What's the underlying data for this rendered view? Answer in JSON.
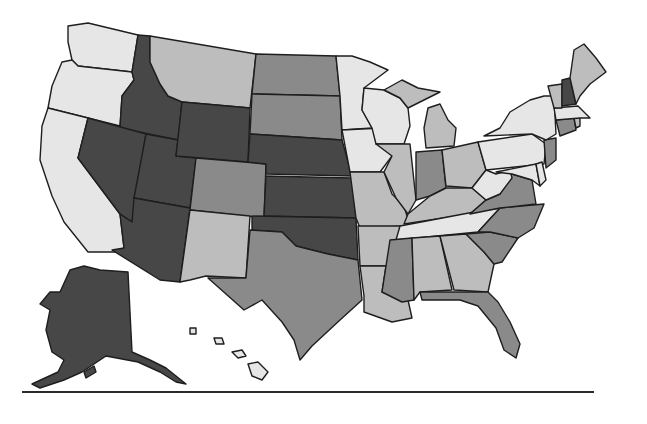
{
  "figure": {
    "type": "choropleth-map",
    "region": "United States (50 states, Alaska and Hawaii inset)",
    "legend_visible": false,
    "title_visible": false
  },
  "shades": {
    "very_light": "#e6e6e6",
    "light": "#bdbdbd",
    "medium": "#8a8a8a",
    "dark": "#474747",
    "stroke": "#1e1e1e",
    "rule": "#2a2a2a"
  },
  "states": {
    "WA": "very_light",
    "OR": "very_light",
    "CA": "very_light",
    "ID": "dark",
    "NV": "dark",
    "UT": "dark",
    "AZ": "dark",
    "WY": "dark",
    "MT": "light",
    "CO": "medium",
    "NM": "light",
    "ND": "medium",
    "SD": "medium",
    "NE": "dark",
    "KS": "dark",
    "OK": "dark",
    "TX": "medium",
    "MN": "very_light",
    "IA": "very_light",
    "MO": "light",
    "AR": "light",
    "LA": "light",
    "WI": "very_light",
    "IL": "light",
    "MI": "light",
    "IN": "medium",
    "OH": "light",
    "KY": "light",
    "TN": "very_light",
    "MS": "medium",
    "AL": "light",
    "GA": "light",
    "FL": "medium",
    "SC": "medium",
    "NC": "medium",
    "VA": "medium",
    "WV": "very_light",
    "PA": "very_light",
    "NY": "very_light",
    "NJ": "medium",
    "DE": "very_light",
    "MD": "very_light",
    "CT": "medium",
    "RI": "light",
    "MA": "very_light",
    "VT": "light",
    "NH": "dark",
    "ME": "light",
    "AK": "dark",
    "HI": "very_light"
  },
  "footer": {
    "rule": true
  }
}
